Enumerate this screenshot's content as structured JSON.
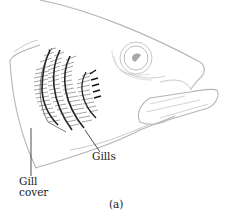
{
  "figure": {
    "caption": "(a)",
    "labels": {
      "gills": "Gills",
      "gill_cover_line1": "Gill",
      "gill_cover_line2": "cover"
    },
    "colors": {
      "outline": "#b8b8b8",
      "gill_ink": "#222222",
      "label_text": "#1a1a1a",
      "background": "#ffffff"
    }
  }
}
